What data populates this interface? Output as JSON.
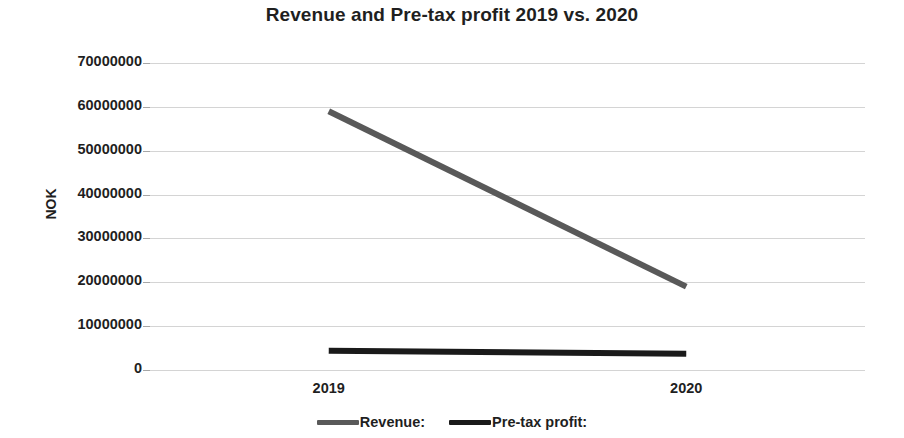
{
  "chart_data": {
    "type": "line",
    "title": "Revenue and Pre-tax profit 2019 vs. 2020",
    "xlabel": "",
    "ylabel": "NOK",
    "categories": [
      "2019",
      "2020"
    ],
    "x_tick_labels": [
      "2019",
      "2020"
    ],
    "y_tick_labels": [
      "70000000",
      "60000000",
      "50000000",
      "40000000",
      "30000000",
      "20000000",
      "10000000",
      "0"
    ],
    "y_ticks": [
      70000000,
      60000000,
      50000000,
      40000000,
      30000000,
      20000000,
      10000000,
      0
    ],
    "ylim": [
      0,
      70000000
    ],
    "grid": "horizontal",
    "legend_position": "bottom",
    "series": [
      {
        "name": "Revenue:",
        "color": "#595959",
        "values": [
          59000000,
          19000000
        ]
      },
      {
        "name": "Pre-tax profit:",
        "color": "#1a1a1a",
        "values": [
          4400000,
          3700000
        ]
      }
    ]
  },
  "legend": {
    "items": [
      {
        "label": "Revenue:",
        "color": "#595959",
        "swatch_name": "legend-swatch-revenue"
      },
      {
        "label": "Pre-tax profit:",
        "color": "#1a1a1a",
        "swatch_name": "legend-swatch-pretax-profit"
      }
    ]
  }
}
